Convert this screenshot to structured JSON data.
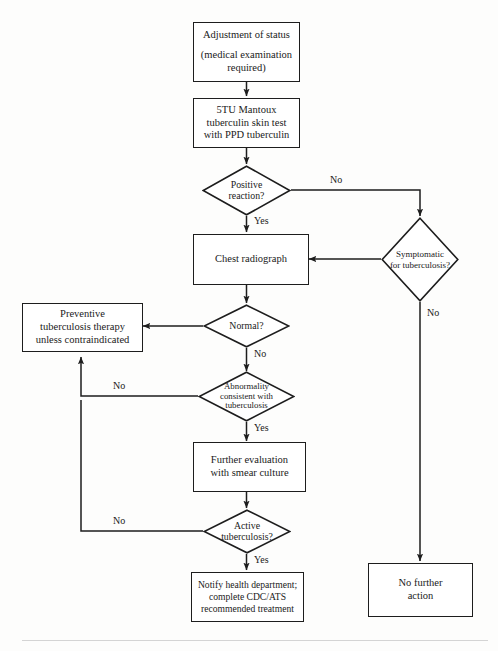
{
  "diagram": {
    "type": "flowchart",
    "nodes": [
      {
        "id": "adjustment",
        "shape": "process",
        "lines": [
          "Adjustment of status",
          "",
          "(medical examination",
          "required)"
        ]
      },
      {
        "id": "mantoux",
        "shape": "process",
        "lines": [
          "5TU Mantoux",
          "tuberculin skin test",
          "with PPD tuberculin"
        ]
      },
      {
        "id": "positive-reaction",
        "shape": "decision",
        "lines": [
          "Positive",
          "reaction?"
        ]
      },
      {
        "id": "symptomatic",
        "shape": "decision",
        "lines": [
          "Symptomatic",
          "for tuberculosis?"
        ]
      },
      {
        "id": "chest-radiograph",
        "shape": "process",
        "lines": [
          "Chest radiograph"
        ]
      },
      {
        "id": "normal",
        "shape": "decision",
        "lines": [
          "Normal?"
        ]
      },
      {
        "id": "preventive-therapy",
        "shape": "process",
        "lines": [
          "Preventive",
          "tuberculosis therapy",
          "unless contraindicated"
        ]
      },
      {
        "id": "abnormality",
        "shape": "decision",
        "lines": [
          "Abnormality",
          "consistent with",
          "tuberculosis"
        ]
      },
      {
        "id": "further-evaluation",
        "shape": "process",
        "lines": [
          "Further evaluation",
          "with smear culture"
        ]
      },
      {
        "id": "active-tuberculosis",
        "shape": "decision",
        "lines": [
          "Active",
          "tuberculosis?"
        ]
      },
      {
        "id": "notify",
        "shape": "process",
        "lines": [
          "Notify health department;",
          "complete CDC/ATS",
          "recommended treatment"
        ]
      },
      {
        "id": "no-further-action",
        "shape": "process",
        "lines": [
          "No further",
          "action"
        ]
      }
    ],
    "edge_labels": {
      "positive_no": "No",
      "positive_yes": "Yes",
      "symptomatic_no": "No",
      "normal_no": "No",
      "abnormality_no": "No",
      "abnormality_yes": "Yes",
      "active_no": "No",
      "active_yes": "Yes"
    },
    "colors": {
      "stroke": "#1d1d1d",
      "text": "#1a1a1a",
      "background": "#fdfdfc"
    }
  }
}
